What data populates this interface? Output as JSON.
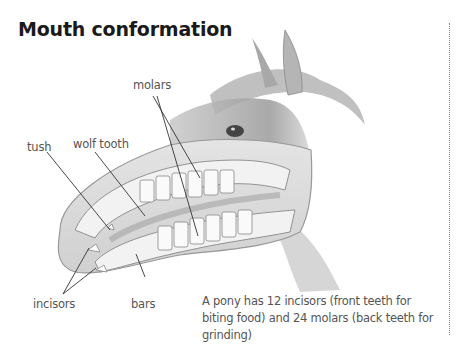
{
  "title": "Mouth conformation",
  "labels": {
    "molars": "molars",
    "tush": "tush",
    "wolf_tooth": "wolf tooth",
    "incisors": "incisors",
    "bars": "bars"
  },
  "caption": "A pony has 12 incisors (front teeth for biting food) and 24 molars (back teeth for grinding)",
  "colors": {
    "text_dark": "#1a1a1a",
    "label_grey": "#555555",
    "line": "#333333",
    "divider": "#888888"
  }
}
